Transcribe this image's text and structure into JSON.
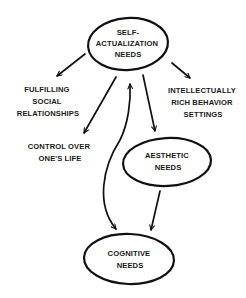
{
  "diagram": {
    "type": "concept-map",
    "background": "#ffffff",
    "stroke_color": "#111111",
    "nodes": [
      {
        "id": "self_actualization",
        "shape": "ellipse",
        "lines": [
          "SELF-",
          "ACTUALIZATION",
          "NEEDS"
        ]
      },
      {
        "id": "social",
        "shape": "text",
        "lines": [
          "FULFILLING",
          "SOCIAL",
          "RELATIONSHIPS"
        ]
      },
      {
        "id": "intellectual",
        "shape": "text",
        "lines": [
          "INTELLECTUALLY",
          "RICH BEHAVIOR",
          "SETTINGS"
        ]
      },
      {
        "id": "control",
        "shape": "text",
        "lines": [
          "CONTROL OVER",
          "ONE'S LIFE"
        ]
      },
      {
        "id": "aesthetic",
        "shape": "ellipse",
        "lines": [
          "AESTHETIC",
          "NEEDS"
        ]
      },
      {
        "id": "cognitive",
        "shape": "ellipse",
        "lines": [
          "COGNITIVE",
          "NEEDS"
        ]
      }
    ],
    "edges": [
      {
        "from": "self_actualization",
        "to": "social",
        "style": "straight-arrow"
      },
      {
        "from": "self_actualization",
        "to": "intellectual",
        "style": "straight-arrow"
      },
      {
        "from": "self_actualization",
        "to": "control",
        "style": "straight-arrow"
      },
      {
        "from": "self_actualization",
        "to": "aesthetic",
        "style": "straight-arrow"
      },
      {
        "from": "aesthetic",
        "to": "cognitive",
        "style": "straight-arrow"
      },
      {
        "from": "self_actualization",
        "to": "cognitive",
        "style": "curved-double-arrow"
      }
    ]
  }
}
